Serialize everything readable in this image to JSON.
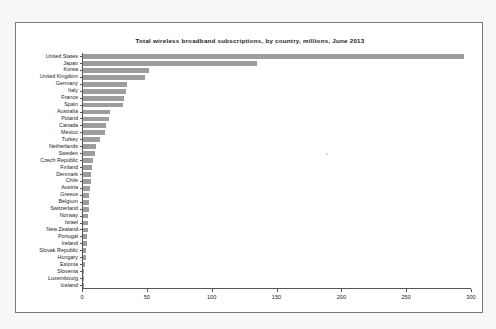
{
  "chart_data": {
    "type": "bar",
    "orientation": "horizontal",
    "title": "Total wireless broadband  subscriptions, by country, millions, June 2013",
    "xlabel": "",
    "ylabel": "",
    "xlim": [
      0,
      300
    ],
    "xticks": [
      0,
      50,
      100,
      150,
      200,
      250,
      300
    ],
    "grid": false,
    "legend": null,
    "bar_color": "#9d9d9d",
    "categories": [
      "United States",
      "Japan",
      "Korea",
      "United Kingdom",
      "Germany",
      "Italy",
      "France",
      "Spain",
      "Australia",
      "Poland",
      "Canada",
      "Mexico",
      "Turkey",
      "Netherlands",
      "Sweden",
      "Czech Republic",
      "Finland",
      "Denmark",
      "Chile",
      "Austria",
      "Greece",
      "Belgium",
      "Switzerland",
      "Norway",
      "Israel",
      "New Zealand",
      "Portugal",
      "Ireland",
      "Slovak Republic",
      "Hungary",
      "Estonia",
      "Slovenia",
      "Luxembourg",
      "Iceland"
    ],
    "values": [
      294,
      134,
      51,
      48,
      34,
      33,
      32,
      31,
      21,
      20,
      18,
      17,
      13,
      10,
      9,
      8,
      7,
      6.5,
      6,
      5.5,
      5,
      4.8,
      4.5,
      4.2,
      4,
      3.6,
      3.4,
      3.2,
      2.6,
      2.4,
      1.2,
      1.0,
      0.5,
      0.3
    ]
  },
  "axis": {
    "tick_labels": [
      "0",
      "50",
      "100",
      "150",
      "200",
      "250",
      "300"
    ]
  }
}
